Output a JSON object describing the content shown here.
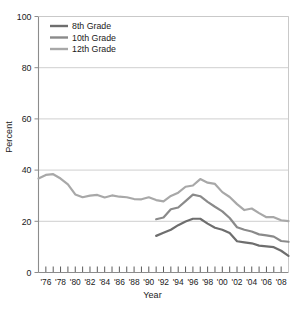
{
  "chart_data": {
    "type": "line",
    "title": "",
    "xlabel": "Year",
    "ylabel": "Percent",
    "ylim": [
      0,
      100
    ],
    "xlim": [
      1975,
      2009
    ],
    "yticks": [
      0,
      20,
      40,
      60,
      80,
      100
    ],
    "ytick_labels": [
      "0",
      "20",
      "40",
      "60",
      "80",
      "100"
    ],
    "xtick_labels": [
      "'76",
      "'78",
      "'80",
      "'82",
      "'84",
      "'86",
      "'88",
      "'90",
      "'92",
      "'94",
      "'96",
      "'98",
      "'00",
      "'02",
      "'04",
      "'06",
      "'08"
    ],
    "xtick_years": [
      1976,
      1978,
      1980,
      1982,
      1984,
      1986,
      1988,
      1990,
      1992,
      1994,
      1996,
      1998,
      2000,
      2002,
      2004,
      2006,
      2008
    ],
    "grid": "horizontal",
    "legend_position": "top-left-inside",
    "series": [
      {
        "name": "8th Grade",
        "color": "#6e6e6e",
        "x": [
          1991,
          1992,
          1993,
          1994,
          1995,
          1996,
          1997,
          1998,
          1999,
          2000,
          2001,
          2002,
          2003,
          2004,
          2005,
          2006,
          2007,
          2008,
          2009
        ],
        "values": [
          14.3,
          15.5,
          16.7,
          18.5,
          19.9,
          21.0,
          21.0,
          19.1,
          17.5,
          16.7,
          15.4,
          12.2,
          11.8,
          11.4,
          10.5,
          10.2,
          9.9,
          8.5,
          6.5
        ]
      },
      {
        "name": "10th Grade",
        "color": "#8a8a8a",
        "x": [
          1991,
          1992,
          1993,
          1994,
          1995,
          1996,
          1997,
          1998,
          1999,
          2000,
          2001,
          2002,
          2003,
          2004,
          2005,
          2006,
          2007,
          2008,
          2009
        ],
        "values": [
          20.8,
          21.5,
          24.7,
          25.4,
          27.9,
          30.4,
          29.8,
          27.6,
          25.7,
          23.9,
          21.3,
          17.7,
          16.7,
          16.0,
          14.9,
          14.5,
          14.0,
          12.3,
          12.0
        ]
      },
      {
        "name": "12th Grade",
        "color": "#a8a8a8",
        "x": [
          1975,
          1976,
          1977,
          1978,
          1979,
          1980,
          1981,
          1982,
          1983,
          1984,
          1985,
          1986,
          1987,
          1988,
          1989,
          1990,
          1991,
          1992,
          1993,
          1994,
          1995,
          1996,
          1997,
          1998,
          1999,
          2000,
          2001,
          2002,
          2003,
          2004,
          2005,
          2006,
          2007,
          2008,
          2009
        ],
        "values": [
          36.7,
          38.1,
          38.4,
          36.7,
          34.4,
          30.5,
          29.4,
          30.0,
          30.3,
          29.3,
          30.1,
          29.6,
          29.4,
          28.7,
          28.6,
          29.4,
          28.3,
          27.8,
          29.9,
          31.2,
          33.5,
          34.0,
          36.5,
          35.1,
          34.6,
          31.4,
          29.5,
          26.7,
          24.4,
          25.0,
          23.2,
          21.6,
          21.6,
          20.4,
          20.1
        ]
      }
    ]
  },
  "legend": {
    "items": [
      {
        "label": "8th Grade"
      },
      {
        "label": "10th Grade"
      },
      {
        "label": "12th Grade"
      }
    ]
  },
  "axes": {
    "y_title": "Percent",
    "x_title": "Year"
  },
  "colors": {
    "grade8": "#6e6e6e",
    "grade10": "#8a8a8a",
    "grade12": "#a8a8a8",
    "axis": "#8c8c8c",
    "grid": "#c9c9c9",
    "text": "#1a1a1a"
  }
}
